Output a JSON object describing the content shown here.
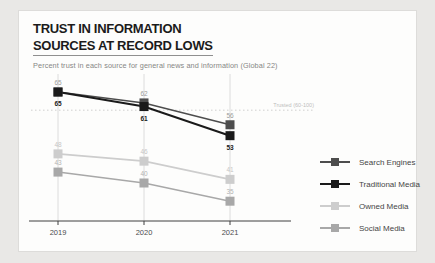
{
  "window": {
    "background": "#e9e8e6",
    "card_background": "#fdfdfc"
  },
  "header": {
    "title_line1": "TRUST IN INFORMATION",
    "title_line2": "SOURCES AT RECORD LOWS",
    "subtitle": "Percent trust in each source for general news and information (Global 22)"
  },
  "chart_data": {
    "type": "line",
    "title": "TRUST IN INFORMATION SOURCES AT RECORD LOWS",
    "subtitle": "Percent trust in each source for general news and information (Global 22)",
    "x": [
      "2019",
      "2020",
      "2021"
    ],
    "series": [
      {
        "name": "Search Engines",
        "values": [
          65,
          62,
          56
        ],
        "color": "#4d4d4d",
        "label_color": "#9b9b9b",
        "label_pos": "above",
        "bold_labels": false
      },
      {
        "name": "Traditional Media",
        "values": [
          65,
          61,
          53
        ],
        "color": "#1a1a1a",
        "label_color": "#1a1a1a",
        "label_pos": "below",
        "bold_labels": true
      },
      {
        "name": "Owned Media",
        "values": [
          48,
          46,
          41
        ],
        "color": "#cdcdcd",
        "label_color": "#c6c6c6",
        "label_pos": "above",
        "bold_labels": false
      },
      {
        "name": "Social Media",
        "values": [
          43,
          40,
          35
        ],
        "color": "#a8a8a8",
        "label_color": "#b3b3b3",
        "label_pos": "above",
        "bold_labels": false
      }
    ],
    "reference_line": {
      "value": 60,
      "label": "Trusted (60-100)"
    },
    "ylim": [
      30,
      70
    ],
    "xlabel": "",
    "ylabel": "",
    "grid": "vertical-per-year",
    "legend_position": "right"
  },
  "colors": {
    "gridline": "#dcdcdc",
    "axis": "#3f3f3f",
    "year_label": "#4c4c4c",
    "reference_line": "#cfcfcf",
    "reference_label": "#bdbdbd"
  }
}
